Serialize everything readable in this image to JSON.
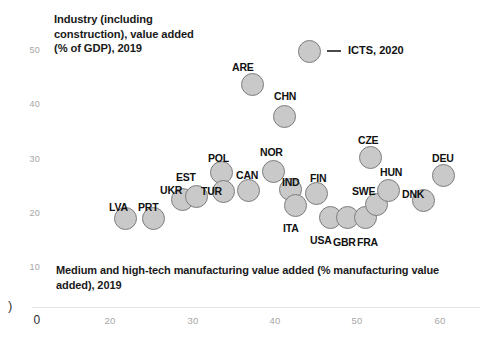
{
  "chart_data": {
    "type": "scatter",
    "title": "",
    "xlabel": "Medium and high-tech manufacturing value added (% manufacturing value added), 2019",
    "ylabel": "Industry (including construction), value added (% of GDP), 2019",
    "xlim": [
      0,
      62
    ],
    "ylim": [
      6,
      54
    ],
    "xticks": [
      "0",
      "20",
      "30",
      "40",
      "50",
      "60"
    ],
    "yticks": [
      "50",
      "40",
      "30",
      "20",
      "10"
    ],
    "grid": false,
    "legend": {
      "position": "top-right",
      "entries": [
        {
          "label": "ICTS, 2020",
          "marker": "bubble",
          "color": "#c9c9c9"
        }
      ]
    },
    "marker_fill": "#c9c9c9",
    "marker_edge": "#7d7d7d",
    "points": [
      {
        "label": "LVA",
        "x": 22.0,
        "y": 19.8,
        "px": 125,
        "py": 218,
        "r": 11.5,
        "lx": 109,
        "ly": 201
      },
      {
        "label": "PRT",
        "x": 25.2,
        "y": 19.8,
        "px": 153,
        "py": 218,
        "r": 11.5,
        "lx": 138,
        "ly": 201
      },
      {
        "label": "UKR",
        "x": 28.6,
        "y": 22.0,
        "px": 182,
        "py": 199,
        "r": 11.5,
        "lx": 160,
        "ly": 184
      },
      {
        "label": "EST",
        "x": 30.2,
        "y": 22.4,
        "px": 196,
        "py": 196,
        "r": 11.5,
        "lx": 176,
        "ly": 171
      },
      {
        "label": "POL",
        "x": 34.3,
        "y": 25.2,
        "px": 221,
        "py": 172,
        "r": 11.5,
        "lx": 208,
        "ly": 152
      },
      {
        "label": "TUR",
        "x": 34.5,
        "y": 23.0,
        "px": 223,
        "py": 191,
        "r": 11.5,
        "lx": 201,
        "ly": 185
      },
      {
        "label": "CAN",
        "x": 37.4,
        "y": 23.1,
        "px": 248,
        "py": 190,
        "r": 11.5,
        "lx": 236,
        "ly": 169
      },
      {
        "label": "NOR",
        "x": 40.3,
        "y": 25.3,
        "px": 273,
        "py": 171,
        "r": 11.5,
        "lx": 260,
        "ly": 146
      },
      {
        "label": "IND",
        "x": 42.3,
        "y": 23.2,
        "px": 290,
        "py": 189,
        "r": 11.5,
        "lx": 282,
        "ly": 176
      },
      {
        "label": "ITA",
        "x": 42.9,
        "y": 21.3,
        "px": 295,
        "py": 205,
        "r": 11.5,
        "lx": 283,
        "ly": 222
      },
      {
        "label": "FIN",
        "x": 45.4,
        "y": 22.8,
        "px": 316,
        "py": 193,
        "r": 11.5,
        "lx": 310,
        "ly": 172
      },
      {
        "label": "USA",
        "x": 46.9,
        "y": 19.9,
        "px": 330,
        "py": 217,
        "r": 11.5,
        "lx": 310,
        "ly": 234
      },
      {
        "label": "GBR",
        "x": 48.9,
        "y": 19.9,
        "px": 347,
        "py": 217,
        "r": 11.5,
        "lx": 333,
        "ly": 236
      },
      {
        "label": "FRA",
        "x": 51.0,
        "y": 19.9,
        "px": 365,
        "py": 217,
        "r": 11.5,
        "lx": 357,
        "ly": 236
      },
      {
        "label": "CZE",
        "x": 51.6,
        "y": 29.0,
        "px": 370,
        "py": 157,
        "r": 11.5,
        "lx": 358,
        "ly": 134
      },
      {
        "label": "SWE",
        "x": 52.3,
        "y": 21.6,
        "px": 376,
        "py": 204,
        "r": 11.5,
        "lx": 352,
        "ly": 185
      },
      {
        "label": "HUN",
        "x": 53.7,
        "y": 23.1,
        "px": 388,
        "py": 190,
        "r": 11.5,
        "lx": 380,
        "ly": 166
      },
      {
        "label": "DNK",
        "x": 57.8,
        "y": 21.9,
        "px": 423,
        "py": 200,
        "r": 11.5,
        "lx": 402,
        "ly": 188
      },
      {
        "label": "DEU",
        "x": 60.2,
        "y": 25.0,
        "px": 443,
        "py": 175,
        "r": 11.5,
        "lx": 432,
        "ly": 152
      },
      {
        "label": "ARE",
        "x": 37.0,
        "y": 43.3,
        "px": 252,
        "py": 84,
        "r": 11.5,
        "lx": 232,
        "ly": 61
      },
      {
        "label": "CHN",
        "x": 40.7,
        "y": 39.0,
        "px": 284,
        "py": 116,
        "r": 11.5,
        "lx": 274,
        "ly": 90
      }
    ]
  },
  "axes": {
    "y_title": "Industry (including construction), value added (% of GDP), 2019",
    "x_title": "Medium and high-tech manufacturing value added (% manufacturing value added), 2019",
    "y_ticks": [
      {
        "label": "50",
        "py": 50
      },
      {
        "label": "40",
        "py": 104
      },
      {
        "label": "30",
        "py": 159
      },
      {
        "label": "20",
        "py": 213
      },
      {
        "label": "10",
        "py": 267
      }
    ],
    "x_ticks": [
      {
        "label": "0",
        "px": 37
      },
      {
        "label": "20",
        "px": 110
      },
      {
        "label": "30",
        "px": 193
      },
      {
        "label": "40",
        "px": 275
      },
      {
        "label": "50",
        "px": 357
      },
      {
        "label": "60",
        "px": 440
      }
    ],
    "stray_glyph": ")"
  },
  "legend": {
    "label": "ICTS, 2020"
  }
}
